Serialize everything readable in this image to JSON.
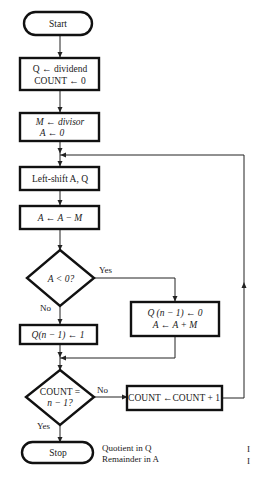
{
  "flowchart": {
    "start": "Start",
    "init1": {
      "line1": "Q ← dividend",
      "line2": "COUNT ← 0"
    },
    "init2": {
      "line1": "M ← divisor",
      "line2": "A ← 0"
    },
    "shift": "Left-shift A, Q",
    "subtract": "A ← A − M",
    "decision1": {
      "text": "A < 0?",
      "yes": "Yes",
      "no": "No"
    },
    "restore": {
      "line1": "Q (n − 1) ← 0",
      "line2": "A ← A + M"
    },
    "set_bit": "Q(n − 1) ← 1",
    "decision2": {
      "line1": "COUNT =",
      "line2": "n − 1?",
      "yes": "Yes",
      "no": "No"
    },
    "increment": "COUNT ←COUNT + 1",
    "stop": "Stop",
    "result": {
      "line1": "Quotient in Q",
      "line2": "Remainder in A"
    }
  },
  "edge_fragments": {
    "frag1": "I",
    "frag2": "I"
  }
}
